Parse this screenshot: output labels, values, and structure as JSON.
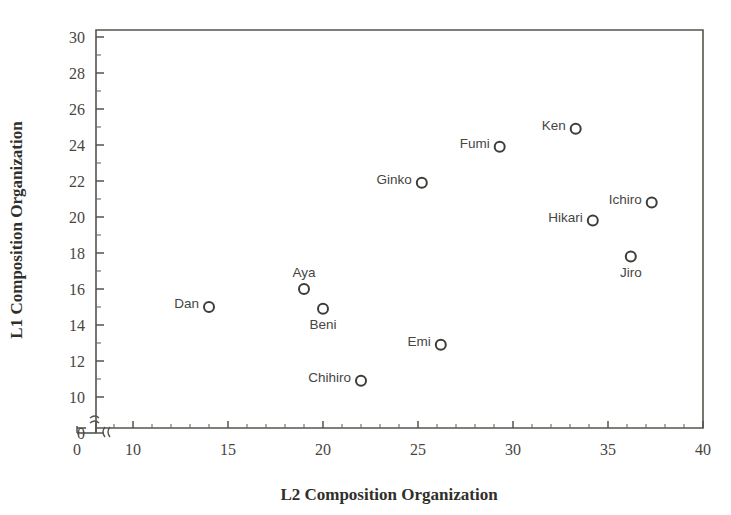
{
  "chart_data": {
    "type": "scatter",
    "title": "",
    "xlabel": "L2 Composition Organization",
    "ylabel": "L1 Composition Organization",
    "xlim": [
      5,
      40
    ],
    "ylim": [
      9,
      30
    ],
    "x_ticks": [
      0,
      10,
      15,
      20,
      25,
      30,
      35,
      40
    ],
    "y_ticks": [
      0,
      10,
      12,
      14,
      16,
      18,
      20,
      22,
      24,
      26,
      28,
      30
    ],
    "x_axis_break": true,
    "y_axis_break": true,
    "grid": false,
    "legend": false,
    "marker": "open-circle",
    "points": [
      {
        "label": "Dan",
        "x": 14.0,
        "y": 15.0,
        "label_pos": "left"
      },
      {
        "label": "Aya",
        "x": 19.0,
        "y": 16.0,
        "label_pos": "above"
      },
      {
        "label": "Beni",
        "x": 20.0,
        "y": 14.9,
        "label_pos": "below"
      },
      {
        "label": "Chihiro",
        "x": 22.0,
        "y": 10.9,
        "label_pos": "left"
      },
      {
        "label": "Ginko",
        "x": 25.2,
        "y": 21.9,
        "label_pos": "left"
      },
      {
        "label": "Emi",
        "x": 26.2,
        "y": 12.9,
        "label_pos": "left"
      },
      {
        "label": "Fumi",
        "x": 29.3,
        "y": 23.9,
        "label_pos": "left"
      },
      {
        "label": "Ken",
        "x": 33.3,
        "y": 24.9,
        "label_pos": "left"
      },
      {
        "label": "Hikari",
        "x": 34.2,
        "y": 19.8,
        "label_pos": "left"
      },
      {
        "label": "Jiro",
        "x": 36.2,
        "y": 17.8,
        "label_pos": "below"
      },
      {
        "label": "Ichiro",
        "x": 37.3,
        "y": 20.8,
        "label_pos": "left"
      }
    ]
  },
  "axis": {
    "x_title": "L2 Composition Organization",
    "y_title": "L1 Composition Organization",
    "x_tick_labels": [
      "0",
      "10",
      "15",
      "20",
      "25",
      "30",
      "35",
      "40"
    ],
    "y_tick_labels": [
      "0",
      "10",
      "12",
      "14",
      "16",
      "18",
      "20",
      "22",
      "24",
      "26",
      "28",
      "30"
    ]
  },
  "colors": {
    "axis": "#55554d",
    "text": "#46463f",
    "marker_stroke": "#3d3d38",
    "background": "#ffffff"
  }
}
